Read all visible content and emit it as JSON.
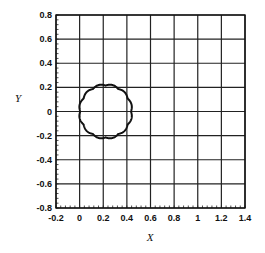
{
  "chart_data": {
    "type": "line",
    "title": "",
    "xlabel": "X",
    "ylabel": "Y",
    "xlim": [
      -0.2,
      1.4
    ],
    "ylim": [
      -0.8,
      0.8
    ],
    "grid": true,
    "legend": null,
    "x_ticks": [
      "-0.2",
      "0",
      "0.2",
      "0.4",
      "0.6",
      "0.8",
      "1",
      "1.2",
      "1.4"
    ],
    "y_ticks": [
      "0.8",
      "0.6",
      "0.4",
      "0.2",
      "0",
      "-0.2",
      "-0.4",
      "-0.6",
      "-0.8"
    ],
    "series": [
      {
        "name": "closed scalloped curve",
        "shape": "scalloped circle",
        "center": [
          0.22,
          0.0
        ],
        "radius": 0.215,
        "scallop_count": 12,
        "scallop_amplitude": 0.012,
        "color": "#111111"
      }
    ]
  }
}
